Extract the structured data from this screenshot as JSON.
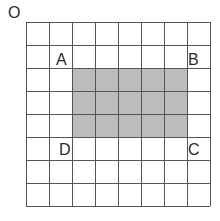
{
  "diagram": {
    "type": "grid-with-shaded-rectangle",
    "grid": {
      "columns": 8,
      "rows": 8,
      "origin_px": [
        26,
        22
      ],
      "cell_px": 23,
      "line_color": "#555555",
      "background": "#ffffff"
    },
    "shaded_region": {
      "col_start": 2,
      "col_end": 6,
      "row_start": 2,
      "row_end": 4,
      "fill": "#bdbdbd"
    },
    "labels": {
      "origin": "O",
      "a": "A",
      "b": "B",
      "c": "C",
      "d": "D"
    }
  }
}
